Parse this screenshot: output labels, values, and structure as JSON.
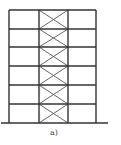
{
  "figure": {
    "caption": "a)",
    "bays": 3,
    "storeys": 6,
    "braced_bay_index": 1,
    "colors": {
      "frame": "#333333",
      "brace": "#555555",
      "ground": "#333333"
    },
    "geometry": {
      "column_x": [
        9,
        39,
        68,
        96
      ],
      "floor_y": [
        10,
        29,
        47,
        66,
        85,
        104,
        123
      ],
      "ground": {
        "y": 123,
        "x1": 1,
        "x2": 108
      }
    }
  }
}
